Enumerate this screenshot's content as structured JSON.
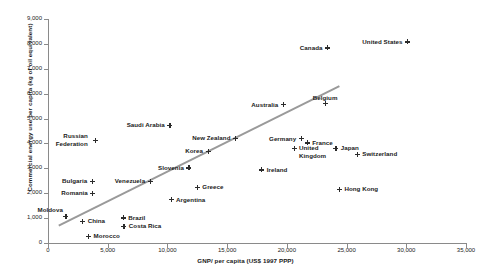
{
  "chart_data": {
    "type": "scatter",
    "title": "",
    "xlabel": "GNP/ per capita (US$ 1997 PPP)",
    "ylabel": "Commercial energy use per capita (kg of  oil equivalent)",
    "xlim": [
      0,
      35000
    ],
    "ylim": [
      0,
      9000
    ],
    "xticks": [
      "0",
      "5,000",
      "10,000",
      "15,000",
      "20,000",
      "25,000",
      "30,000",
      "35,000"
    ],
    "yticks": [
      "0",
      "1,000",
      "2,000",
      "3,000",
      "4,000",
      "5,000",
      "6,000",
      "7,000",
      "8,000",
      "9,000"
    ],
    "grid": false,
    "legend": "none",
    "trendline": {
      "x0": 900,
      "y0": 700,
      "x1": 24400,
      "y1": 6300,
      "color": "#9a9a9a"
    },
    "marker": "plus",
    "marker_color": "#2b2b2b",
    "points": [
      {
        "name": "Moldova",
        "x": 1500,
        "y": 1080,
        "lx": -3,
        "ly": -9,
        "align": "right"
      },
      {
        "name": "Russian Federation",
        "x": 4000,
        "y": 4130,
        "lx": -8,
        "ly": -4,
        "align": "right",
        "multiline": true
      },
      {
        "name": "China",
        "x": 2900,
        "y": 880,
        "lx": 5,
        "ly": -3,
        "align": "left"
      },
      {
        "name": "Morocco",
        "x": 3400,
        "y": 280,
        "lx": 5,
        "ly": -3,
        "align": "left"
      },
      {
        "name": "Bulgaria",
        "x": 3700,
        "y": 2490,
        "lx": -5,
        "ly": -3,
        "align": "right"
      },
      {
        "name": "Romania",
        "x": 3750,
        "y": 1990,
        "lx": -5,
        "ly": -3,
        "align": "right"
      },
      {
        "name": "Brazil",
        "x": 6300,
        "y": 1010,
        "lx": 5,
        "ly": -3,
        "align": "left"
      },
      {
        "name": "Costa Rica",
        "x": 6350,
        "y": 670,
        "lx": 5,
        "ly": -3,
        "align": "left"
      },
      {
        "name": "Venezuela",
        "x": 8550,
        "y": 2480,
        "lx": -5,
        "ly": -3,
        "align": "right"
      },
      {
        "name": "Argentina",
        "x": 10300,
        "y": 1740,
        "lx": 5,
        "ly": -3,
        "align": "left"
      },
      {
        "name": "Saudi Arabia",
        "x": 10200,
        "y": 4730,
        "lx": -5,
        "ly": -3,
        "align": "right"
      },
      {
        "name": "Slovenia",
        "x": 11800,
        "y": 3020,
        "lx": -5,
        "ly": -3,
        "align": "right"
      },
      {
        "name": "Greece",
        "x": 12500,
        "y": 2230,
        "lx": 5,
        "ly": -3,
        "align": "left"
      },
      {
        "name": "Korea",
        "x": 13400,
        "y": 3690,
        "lx": -5,
        "ly": -3,
        "align": "right"
      },
      {
        "name": "New Zealand",
        "x": 15700,
        "y": 4210,
        "lx": -5,
        "ly": -3,
        "align": "right"
      },
      {
        "name": "Ireland",
        "x": 17900,
        "y": 2940,
        "lx": 5,
        "ly": -3,
        "align": "left"
      },
      {
        "name": "Australia",
        "x": 19700,
        "y": 5560,
        "lx": -5,
        "ly": -3,
        "align": "right"
      },
      {
        "name": "Germany",
        "x": 21200,
        "y": 4190,
        "lx": -5,
        "ly": -3,
        "align": "right"
      },
      {
        "name": "United Kingdom",
        "x": 20600,
        "y": 3810,
        "lx": 5,
        "ly": -3,
        "align": "left",
        "multiline": true
      },
      {
        "name": "France",
        "x": 21700,
        "y": 4020,
        "lx": 5,
        "ly": -3,
        "align": "left"
      },
      {
        "name": "Belgium",
        "x": 23200,
        "y": 5600,
        "lx": 0,
        "ly": -9,
        "align": "center"
      },
      {
        "name": "Canada",
        "x": 23400,
        "y": 7840,
        "lx": -5,
        "ly": -3,
        "align": "right"
      },
      {
        "name": "Japan",
        "x": 24100,
        "y": 3810,
        "lx": 5,
        "ly": -3,
        "align": "left"
      },
      {
        "name": "Switzerland",
        "x": 25900,
        "y": 3560,
        "lx": 5,
        "ly": -3,
        "align": "left"
      },
      {
        "name": "Hong Kong",
        "x": 24400,
        "y": 2150,
        "lx": 5,
        "ly": -3,
        "align": "left"
      },
      {
        "name": "United States",
        "x": 30100,
        "y": 8080,
        "lx": -5,
        "ly": -3,
        "align": "right"
      }
    ]
  },
  "figure": {
    "bottom_note": ""
  }
}
